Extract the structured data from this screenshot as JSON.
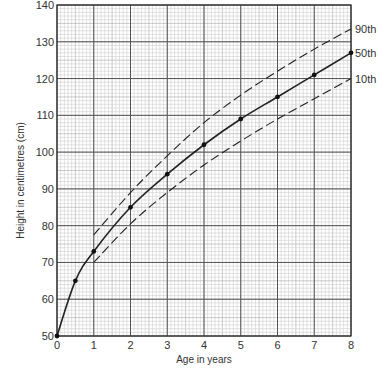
{
  "chart_data": {
    "type": "line",
    "title": "",
    "xlabel": "Age in years",
    "ylabel": "Height in centimetres (cm)",
    "xlim": [
      0,
      8
    ],
    "ylim": [
      50,
      140
    ],
    "x_ticks": [
      0,
      1,
      2,
      3,
      4,
      5,
      6,
      7,
      8
    ],
    "y_ticks": [
      50,
      60,
      70,
      80,
      90,
      100,
      110,
      120,
      130,
      140
    ],
    "grid": true,
    "legend_position": "right-inline",
    "series": [
      {
        "name": "90th",
        "style": "dashed",
        "x": [
          1,
          2,
          3,
          4,
          5,
          6,
          7,
          8
        ],
        "values": [
          77.5,
          89,
          99,
          108,
          115.5,
          122,
          128,
          133.5
        ]
      },
      {
        "name": "50th",
        "style": "solid",
        "markers": true,
        "x": [
          0,
          0.5,
          1,
          2,
          3,
          4,
          5,
          6,
          7,
          8
        ],
        "values": [
          50,
          65,
          73,
          85,
          94,
          102,
          109,
          115,
          121,
          127
        ]
      },
      {
        "name": "10th",
        "style": "dashed",
        "x": [
          1,
          2,
          3,
          4,
          5,
          6,
          7,
          8
        ],
        "values": [
          70,
          80.5,
          89,
          96.5,
          103,
          109,
          114.5,
          120
        ]
      }
    ]
  },
  "labels": {
    "xlabel": "Age in years",
    "ylabel": "Height in centimetres (cm)",
    "p90": "90th",
    "p50": "50th",
    "p10": "10th"
  }
}
